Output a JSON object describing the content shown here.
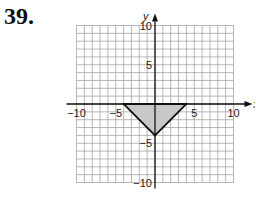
{
  "problem": {
    "number": "39."
  },
  "chart_data": {
    "type": "area",
    "title": "",
    "xlabel": "x",
    "ylabel": "y",
    "xlim": [
      -10,
      10
    ],
    "ylim": [
      -10,
      10
    ],
    "grid": true,
    "x_ticks": [
      -10,
      -5,
      5,
      10
    ],
    "y_ticks": [
      10,
      5,
      -5,
      -10
    ],
    "x_tick_labels": [
      "−10",
      "−5",
      "5",
      "10"
    ],
    "y_tick_labels": [
      "10",
      "5",
      "−5",
      "−10"
    ],
    "shaded_region": {
      "shape": "triangle",
      "vertices": [
        [
          -4,
          0
        ],
        [
          4,
          0
        ],
        [
          0,
          -4
        ]
      ],
      "fill": "#c8c8c8",
      "stroke": "#111111"
    }
  },
  "colors": {
    "grid": "#9a9a9a",
    "axis": "#111111",
    "fill": "#c8c8c8"
  }
}
